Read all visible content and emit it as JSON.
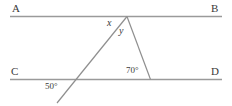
{
  "figure": {
    "background_color": "#ffffff",
    "line_color": "#9a9a9a",
    "ray_color": "#8f8f8f",
    "text_color": "#3a3a3a"
  },
  "lines": {
    "ab": {
      "name": "line-ab",
      "label_left": "A",
      "label_right": "B",
      "x1": 10,
      "y1": 16.5,
      "x2": 222,
      "y2": 16.5
    },
    "cd": {
      "name": "line-cd",
      "label_left": "C",
      "label_right": "D",
      "x1": 10,
      "y1": 79.5,
      "x2": 222,
      "y2": 79.5
    }
  },
  "segments": {
    "transversal": {
      "name": "transversal-ray",
      "x1": 127,
      "y1": 16.5,
      "x2": 57,
      "y2": 103
    },
    "right_leg": {
      "name": "triangle-right-leg",
      "x1": 127,
      "y1": 16.5,
      "x2": 150.5,
      "y2": 79.5
    }
  },
  "points": {
    "apex": {
      "name": "apex-vertex",
      "x": 127,
      "y": 16.5
    },
    "transversal_cd_intersection": {
      "name": "transversal-cd-intersection",
      "x": 74,
      "y": 79.5
    },
    "right_leg_cd_intersection": {
      "name": "right-leg-cd-intersection",
      "x": 150.5,
      "y": 79.5
    }
  },
  "labels": {
    "a": {
      "text": "A",
      "x": 12,
      "y": 3
    },
    "b": {
      "text": "B",
      "x": 211,
      "y": 3
    },
    "c": {
      "text": "C",
      "x": 11,
      "y": 66
    },
    "d": {
      "text": "D",
      "x": 211,
      "y": 66
    },
    "x_angle": {
      "text": "x",
      "x": 107,
      "y": 18
    },
    "y_angle": {
      "text": "y",
      "x": 119,
      "y": 26
    },
    "angle_70": {
      "text": "70°",
      "x": 126,
      "y": 66
    },
    "angle_50": {
      "text": "50°",
      "x": 45,
      "y": 82
    }
  }
}
